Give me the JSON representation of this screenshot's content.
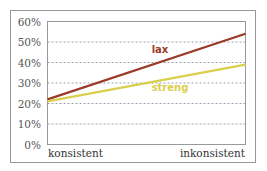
{
  "chart_data": {
    "type": "line",
    "title": "",
    "xlabel": "",
    "ylabel": "",
    "categories": [
      "konsistent",
      "inkonsistent"
    ],
    "y_ticks": [
      "0%",
      "10%",
      "20%",
      "30%",
      "40%",
      "50%",
      "60%"
    ],
    "ylim": [
      0,
      60
    ],
    "grid": true,
    "legend": "inline labels",
    "series": [
      {
        "name": "lax",
        "values": [
          22,
          54
        ],
        "color": "#9b3a2a"
      },
      {
        "name": "streng",
        "values": [
          21,
          39
        ],
        "color": "#d9cf4a"
      }
    ]
  }
}
